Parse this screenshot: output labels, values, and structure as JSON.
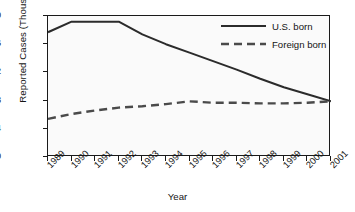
{
  "chart_data": {
    "type": "line",
    "title": "",
    "xlabel": "Year",
    "ylabel": "Reported Cases (Thousands)",
    "categories": [
      "1989",
      "1990",
      "1991",
      "1992",
      "1993",
      "1994",
      "1995",
      "1996",
      "1997",
      "1998",
      "1999",
      "2000",
      "2001"
    ],
    "x": [
      1989,
      1990,
      1991,
      1992,
      1993,
      1994,
      1995,
      1996,
      1997,
      1998,
      1999,
      2000,
      2001
    ],
    "xlim": [
      1989,
      2001
    ],
    "ylim": [
      0,
      20
    ],
    "y_ticks": [
      0,
      4,
      8,
      12,
      16,
      20
    ],
    "grid": false,
    "legend_position": "top-right",
    "series": [
      {
        "name": "U.S. born",
        "style": "solid",
        "color": "#2b2b2b",
        "values": [
          17.7,
          19.2,
          19.2,
          19.2,
          17.4,
          16.0,
          14.8,
          13.6,
          12.4,
          11.1,
          9.9,
          8.9,
          7.9
        ]
      },
      {
        "name": "Foreign born",
        "style": "dashed",
        "color": "#4a4a4a",
        "values": [
          5.4,
          6.1,
          6.6,
          7.0,
          7.2,
          7.5,
          7.9,
          7.7,
          7.7,
          7.6,
          7.6,
          7.7,
          7.9
        ]
      }
    ]
  },
  "axes": {
    "y_title": "Reported Cases (Thousands)",
    "x_title": "Year",
    "y_tick_labels": [
      "20",
      "16",
      "12",
      "8",
      "4",
      "0"
    ],
    "x_tick_labels": [
      "1989",
      "1990",
      "1991",
      "1992",
      "1993",
      "1994",
      "1995",
      "1996",
      "1997",
      "1998",
      "1999",
      "2000",
      "2001"
    ]
  },
  "legend": {
    "items": [
      {
        "label": "U.S. born",
        "style": "solid"
      },
      {
        "label": "Foreign born",
        "style": "dashed"
      }
    ]
  },
  "colors": {
    "ink": "#1a1a1a",
    "plot_background": "#fafafa",
    "page_background": "#ffffff",
    "series_us": "#2b2b2b",
    "series_foreign": "#4a4a4a"
  }
}
